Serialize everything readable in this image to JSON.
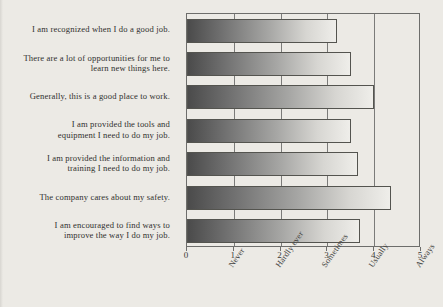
{
  "chart_data": {
    "type": "bar",
    "orientation": "horizontal",
    "title": "",
    "xlabel": "",
    "ylabel": "",
    "xlim": [
      0,
      5
    ],
    "grid": true,
    "legend": "none",
    "categories": [
      "I am recognized when I do a good job.",
      "There are a lot of opportunities for me to learn new things here.",
      "Generally, this is a good place to work.",
      "I am provided the tools and equipment I need to do my job.",
      "I am provided the information and training I need to do my job.",
      "The company cares about my safety.",
      "I am encouraged to find ways to improve the way I do my job."
    ],
    "category_lines": [
      [
        "I am recognized when I do a good job."
      ],
      [
        "There are a lot of opportunities for me to",
        "learn new things here."
      ],
      [
        "Generally, this is a good place to work."
      ],
      [
        "I am provided the tools and",
        "equipment I need to do my job."
      ],
      [
        "I am provided the information and",
        "training I need to do my job."
      ],
      [
        "The company cares about my safety."
      ],
      [
        "I am encouraged to find ways to",
        "improve the way I do my job."
      ]
    ],
    "values": [
      3.2,
      3.5,
      4.0,
      3.5,
      3.65,
      4.35,
      3.7
    ],
    "xticks": [
      0,
      1,
      2,
      3,
      4,
      5
    ],
    "xtick_labels": [
      "0",
      "1",
      "2",
      "3",
      "4",
      "5"
    ],
    "scale_labels": [
      "Never",
      "Hardly ever",
      "Sometimes",
      "Usually",
      "Always"
    ],
    "scale_label_positions": [
      1,
      2,
      3,
      4,
      5
    ],
    "colors": {
      "background": "#eceae5",
      "bar_gradient_start": "#4b4b4b",
      "bar_gradient_end": "#efeeea",
      "bar_border": "#54544f",
      "axis": "#6d6d6b",
      "gridline": "#7b7b79",
      "text": "#30302e"
    }
  }
}
